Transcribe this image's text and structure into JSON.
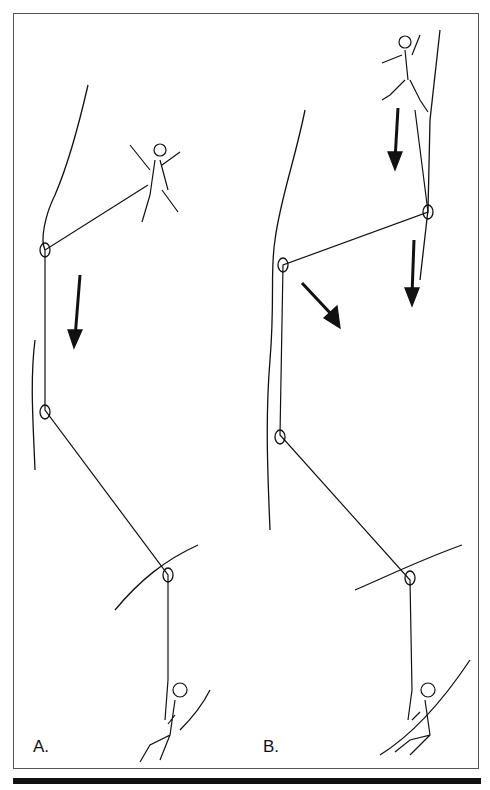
{
  "panels": [
    {
      "label": "A."
    },
    {
      "label": "B."
    }
  ]
}
